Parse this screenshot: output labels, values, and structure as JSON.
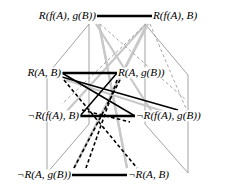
{
  "figure": {
    "type": "cube-lattice-diagram",
    "width": 236,
    "height": 196,
    "background": "#ffffff"
  },
  "colors": {
    "node_text": "#000000",
    "bold_edge": "#000000",
    "frame_edge": "#8a8a8a",
    "light_diagonal": "#c8c8c8",
    "dashed_light": "#9a9a9a",
    "dashed_dark": "#000000"
  },
  "nodes": [
    {
      "id": "n_tl",
      "label": "R(f(A), g(B))",
      "x": 97,
      "y": 16,
      "align": "left",
      "anchor_x": 97,
      "anchor_y": 16
    },
    {
      "id": "n_tr",
      "label": "R(f(A), B)",
      "x": 152,
      "y": 16,
      "align": "right",
      "anchor_x": 152,
      "anchor_y": 16
    },
    {
      "id": "n_ml",
      "label": "R(A, B)",
      "x": 62,
      "y": 73,
      "align": "left",
      "anchor_x": 62,
      "anchor_y": 73
    },
    {
      "id": "n_mr",
      "label": "R(A, g(B))",
      "x": 117,
      "y": 73,
      "align": "right",
      "anchor_x": 117,
      "anchor_y": 73
    },
    {
      "id": "n_bl",
      "label": "¬R(f(A), B)",
      "x": 80,
      "y": 116,
      "align": "left",
      "anchor_x": 80,
      "anchor_y": 116
    },
    {
      "id": "n_br",
      "label": "¬R(f(A), g(B))",
      "x": 135,
      "y": 116,
      "align": "right",
      "anchor_x": 135,
      "anchor_y": 116
    },
    {
      "id": "n_ll",
      "label": "¬R(A, g(B))",
      "x": 72,
      "y": 175,
      "align": "left",
      "anchor_x": 72,
      "anchor_y": 175
    },
    {
      "id": "n_lr",
      "label": "¬R(A, B)",
      "x": 127,
      "y": 175,
      "align": "right",
      "anchor_x": 127,
      "anchor_y": 175
    }
  ],
  "edges": {
    "bold_horizontals": [
      {
        "name": "top-pair-link",
        "x1": 97,
        "y1": 16,
        "x2": 152,
        "y2": 16
      },
      {
        "name": "middle-pair-link",
        "x1": 62,
        "y1": 73,
        "x2": 117,
        "y2": 73
      },
      {
        "name": "lower-pair-link",
        "x1": 80,
        "y1": 116,
        "x2": 135,
        "y2": 116
      },
      {
        "name": "bottom-pair-link",
        "x1": 72,
        "y1": 175,
        "x2": 127,
        "y2": 175
      }
    ],
    "bold_diagonals": [
      {
        "name": "ml-to-br",
        "x1": 62,
        "y1": 73,
        "x2": 135,
        "y2": 116
      },
      {
        "name": "bl-to-mr",
        "x1": 80,
        "y1": 116,
        "x2": 117,
        "y2": 73
      },
      {
        "name": "ml-to-br-2",
        "x1": 62,
        "y1": 77,
        "x2": 178,
        "y2": 110
      }
    ],
    "frame_verticals": [
      {
        "name": "left-front-vertical",
        "x1": 47,
        "y1": 75,
        "x2": 47,
        "y2": 173
      },
      {
        "name": "left-back-vertical",
        "x1": 89,
        "y1": 24,
        "x2": 89,
        "y2": 124
      },
      {
        "name": "right-back-vertical",
        "x1": 145,
        "y1": 24,
        "x2": 145,
        "y2": 124
      },
      {
        "name": "right-front-vertical",
        "x1": 188,
        "y1": 75,
        "x2": 188,
        "y2": 173
      }
    ],
    "frame_slants": [
      {
        "name": "tl-to-ml-slant",
        "x1": 89,
        "y1": 24,
        "x2": 47,
        "y2": 75
      },
      {
        "name": "tr-to-mr-slant",
        "x1": 145,
        "y1": 24,
        "x2": 188,
        "y2": 75
      },
      {
        "name": "bl-to-ll-slant",
        "x1": 89,
        "y1": 124,
        "x2": 47,
        "y2": 173
      },
      {
        "name": "br-to-lr-slant",
        "x1": 145,
        "y1": 124,
        "x2": 188,
        "y2": 173
      }
    ],
    "light_diagonals": [
      {
        "name": "tl-down-long-a",
        "x1": 96,
        "y1": 24,
        "x2": 152,
        "y2": 112
      },
      {
        "name": "tl-down-long-b",
        "x1": 99,
        "y1": 24,
        "x2": 127,
        "y2": 168
      },
      {
        "name": "tr-down-long-a",
        "x1": 148,
        "y1": 24,
        "x2": 74,
        "y2": 168
      },
      {
        "name": "tr-down-long-b",
        "x1": 146,
        "y1": 24,
        "x2": 66,
        "y2": 112
      },
      {
        "name": "ml-cross-a",
        "x1": 66,
        "y1": 80,
        "x2": 178,
        "y2": 116
      },
      {
        "name": "lr-up-a",
        "x1": 127,
        "y1": 168,
        "x2": 99,
        "y2": 24
      },
      {
        "name": "ll-up-a",
        "x1": 74,
        "y1": 168,
        "x2": 146,
        "y2": 26
      }
    ],
    "dashed_light": [
      {
        "name": "tl-dash-to-mr",
        "x1": 100,
        "y1": 24,
        "x2": 186,
        "y2": 100
      },
      {
        "name": "tr-dash-to-ml",
        "x1": 146,
        "y1": 24,
        "x2": 62,
        "y2": 104
      },
      {
        "name": "tr-dash-down",
        "x1": 150,
        "y1": 24,
        "x2": 190,
        "y2": 118
      }
    ],
    "dashed_dark": [
      {
        "name": "ml-dash-to-lr",
        "x1": 64,
        "y1": 80,
        "x2": 137,
        "y2": 168
      },
      {
        "name": "ll-dash-to-mr",
        "x1": 74,
        "y1": 168,
        "x2": 120,
        "y2": 80
      },
      {
        "name": "bl-dash-mid",
        "x1": 82,
        "y1": 110,
        "x2": 130,
        "y2": 122
      },
      {
        "name": "mr-dash-down",
        "x1": 117,
        "y1": 80,
        "x2": 86,
        "y2": 168
      }
    ]
  }
}
